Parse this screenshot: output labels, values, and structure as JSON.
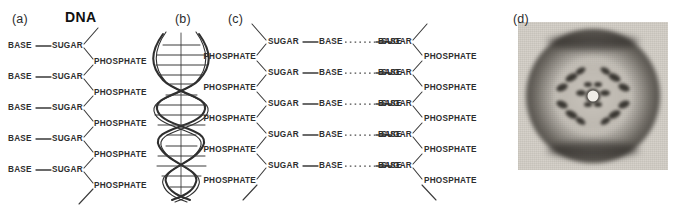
{
  "figure": {
    "width": 678,
    "height": 219,
    "background": "#ffffff",
    "ink": "#2e2e2e"
  },
  "panels": [
    {
      "id": "a",
      "label": "(a)",
      "title": "DNA",
      "type": "single-strand-backbone",
      "rows": 5,
      "row_labels": [
        "BASE",
        "SUGAR",
        "PHOSPHATE"
      ],
      "bond_symbol": "—"
    },
    {
      "id": "b",
      "label": "(b)",
      "title": "",
      "type": "double-helix",
      "rungs": 14,
      "turns": 3
    },
    {
      "id": "c",
      "label": "(c)",
      "title": "",
      "type": "double-strand-ladder",
      "rows": 5,
      "row_labels": [
        "PHOSPHATE",
        "SUGAR",
        "BASE",
        "BASE",
        "SUGAR",
        "PHOSPHATE"
      ],
      "bond_symbol": "—",
      "hydrogen_bond_symbol": "··········"
    },
    {
      "id": "d",
      "label": "(d)",
      "title": "",
      "type": "xray-diffraction-photograph"
    }
  ],
  "panel_a": {
    "label": "(a)",
    "title": "DNA",
    "rows": [
      {
        "base": "BASE",
        "sugar": "SUGAR",
        "phosphate": "PHOSPHATE"
      },
      {
        "base": "BASE",
        "sugar": "SUGAR",
        "phosphate": "PHOSPHATE"
      },
      {
        "base": "BASE",
        "sugar": "SUGAR",
        "phosphate": "PHOSPHATE"
      },
      {
        "base": "BASE",
        "sugar": "SUGAR",
        "phosphate": "PHOSPHATE"
      },
      {
        "base": "BASE",
        "sugar": "SUGAR",
        "phosphate": "PHOSPHATE"
      }
    ]
  },
  "panel_b": {
    "label": "(b)"
  },
  "panel_c": {
    "label": "(c)",
    "rows": [
      {
        "phosphate_left": "PHOSPHATE",
        "sugar_left": "SUGAR",
        "base_left": "BASE",
        "base_right": "BASE",
        "sugar_right": "SUGAR",
        "phosphate_right": "PHOSPHATE"
      },
      {
        "phosphate_left": "PHOSPHATE",
        "sugar_left": "SUGAR",
        "base_left": "BASE",
        "base_right": "BASE",
        "sugar_right": "SUGAR",
        "phosphate_right": "PHOSPHATE"
      },
      {
        "phosphate_left": "PHOSPHATE",
        "sugar_left": "SUGAR",
        "base_left": "BASE",
        "base_right": "BASE",
        "sugar_right": "SUGAR",
        "phosphate_right": "PHOSPHATE"
      },
      {
        "phosphate_left": "PHOSPHATE",
        "sugar_left": "SUGAR",
        "base_left": "BASE",
        "base_right": "BASE",
        "sugar_right": "SUGAR",
        "phosphate_right": "PHOSPHATE"
      },
      {
        "phosphate_left": "PHOSPHATE",
        "sugar_left": "SUGAR",
        "base_left": "BASE",
        "base_right": "BASE",
        "sugar_right": "SUGAR",
        "phosphate_right": "PHOSPHATE"
      }
    ]
  },
  "panel_d": {
    "label": "(d)"
  }
}
